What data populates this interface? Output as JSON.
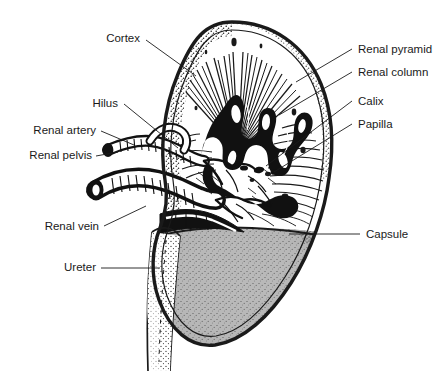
{
  "figure": {
    "background_color": "#ffffff",
    "ink_color": "#1a1a1a",
    "parenchyma_fill": "#b8b8b8",
    "medulla_fill": "#ffffff"
  },
  "labels": {
    "cortex": "Cortex",
    "hilus": "Hilus",
    "renal_artery": "Renal artery",
    "renal_pelvis": "Renal pelvis",
    "renal_vein": "Renal vein",
    "ureter": "Ureter",
    "renal_pyramid": "Renal pyramid",
    "renal_column": "Renal column",
    "calix": "Calix",
    "papilla": "Papilla",
    "capsule": "Capsule"
  }
}
